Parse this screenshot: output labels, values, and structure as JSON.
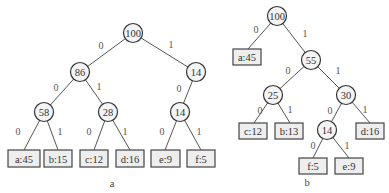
{
  "trees": [
    {
      "caption": "a",
      "nodes": [
        {
          "id": "a_root",
          "label": "100",
          "x": 133,
          "y": 33
        },
        {
          "id": "a_86",
          "label": "86",
          "x": 80,
          "y": 72
        },
        {
          "id": "a_14r",
          "label": "14",
          "x": 196,
          "y": 72
        },
        {
          "id": "a_58",
          "label": "58",
          "x": 44,
          "y": 112
        },
        {
          "id": "a_28",
          "label": "28",
          "x": 108,
          "y": 112
        },
        {
          "id": "a_14",
          "label": "14",
          "x": 180,
          "y": 112
        }
      ],
      "leaves": [
        {
          "id": "a_a",
          "label": "a:45",
          "x": 8,
          "y": 150,
          "w": 32,
          "h": 17
        },
        {
          "id": "a_b",
          "label": "b:15",
          "x": 44,
          "y": 150,
          "w": 28,
          "h": 17
        },
        {
          "id": "a_c",
          "label": "c:12",
          "x": 80,
          "y": 150,
          "w": 28,
          "h": 17
        },
        {
          "id": "a_d",
          "label": "d:16",
          "x": 116,
          "y": 150,
          "w": 28,
          "h": 17
        },
        {
          "id": "a_e",
          "label": "e:9",
          "x": 151,
          "y": 150,
          "w": 29,
          "h": 17
        },
        {
          "id": "a_f",
          "label": "f:5",
          "x": 187,
          "y": 150,
          "w": 28,
          "h": 17
        }
      ],
      "edges": [
        {
          "from": [
            133,
            33
          ],
          "to": [
            80,
            72
          ],
          "label": "0",
          "lx": 101,
          "ly": 45
        },
        {
          "from": [
            133,
            33
          ],
          "to": [
            196,
            72
          ],
          "label": "1",
          "lx": 171,
          "ly": 44
        },
        {
          "from": [
            80,
            72
          ],
          "to": [
            44,
            112
          ],
          "label": "0",
          "lx": 56,
          "ly": 87
        },
        {
          "from": [
            80,
            72
          ],
          "to": [
            108,
            112
          ],
          "label": "1",
          "lx": 99,
          "ly": 86
        },
        {
          "from": [
            196,
            72
          ],
          "to": [
            180,
            112
          ],
          "label": "0",
          "lx": 179,
          "ly": 88
        },
        {
          "from": [
            44,
            112
          ],
          "to": [
            24,
            150
          ],
          "label": "0",
          "lx": 18,
          "ly": 131
        },
        {
          "from": [
            44,
            112
          ],
          "to": [
            58,
            150
          ],
          "label": "1",
          "lx": 60,
          "ly": 131
        },
        {
          "from": [
            108,
            112
          ],
          "to": [
            94,
            150
          ],
          "label": "0",
          "lx": 89,
          "ly": 131
        },
        {
          "from": [
            108,
            112
          ],
          "to": [
            130,
            150
          ],
          "label": "1",
          "lx": 125,
          "ly": 131
        },
        {
          "from": [
            180,
            112
          ],
          "to": [
            165,
            150
          ],
          "label": "0",
          "lx": 162,
          "ly": 131
        },
        {
          "from": [
            180,
            112
          ],
          "to": [
            201,
            150
          ],
          "label": "1",
          "lx": 199,
          "ly": 131
        }
      ],
      "caption_pos": {
        "x": 112,
        "y": 183
      }
    },
    {
      "caption": "b",
      "nodes": [
        {
          "id": "b_root",
          "label": "100",
          "x": 277,
          "y": 16
        },
        {
          "id": "b_55",
          "label": "55",
          "x": 311,
          "y": 60
        },
        {
          "id": "b_25",
          "label": "25",
          "x": 273,
          "y": 95
        },
        {
          "id": "b_30",
          "label": "30",
          "x": 346,
          "y": 95
        },
        {
          "id": "b_14",
          "label": "14",
          "x": 327,
          "y": 130
        }
      ],
      "leaves": [
        {
          "id": "b_a",
          "label": "a:45",
          "x": 233,
          "y": 49,
          "w": 28,
          "h": 16
        },
        {
          "id": "b_c",
          "label": "c:12",
          "x": 239,
          "y": 123,
          "w": 28,
          "h": 16
        },
        {
          "id": "b_b",
          "label": "b:13",
          "x": 275,
          "y": 123,
          "w": 28,
          "h": 16
        },
        {
          "id": "b_d",
          "label": "d:16",
          "x": 356,
          "y": 123,
          "w": 28,
          "h": 16
        },
        {
          "id": "b_f",
          "label": "f:5",
          "x": 299,
          "y": 158,
          "w": 28,
          "h": 16
        },
        {
          "id": "b_e",
          "label": "e:9",
          "x": 335,
          "y": 158,
          "w": 28,
          "h": 16
        }
      ],
      "edges": [
        {
          "from": [
            277,
            16
          ],
          "to": [
            248,
            49
          ],
          "label": "0",
          "lx": 256,
          "ly": 29
        },
        {
          "from": [
            277,
            16
          ],
          "to": [
            311,
            60
          ],
          "label": "1",
          "lx": 305,
          "ly": 33
        },
        {
          "from": [
            311,
            60
          ],
          "to": [
            273,
            95
          ],
          "label": "0",
          "lx": 288,
          "ly": 70
        },
        {
          "from": [
            311,
            60
          ],
          "to": [
            346,
            95
          ],
          "label": "1",
          "lx": 338,
          "ly": 70
        },
        {
          "from": [
            273,
            95
          ],
          "to": [
            254,
            123
          ],
          "label": "0",
          "lx": 260,
          "ly": 110
        },
        {
          "from": [
            273,
            95
          ],
          "to": [
            290,
            123
          ],
          "label": "1",
          "lx": 290,
          "ly": 109
        },
        {
          "from": [
            346,
            95
          ],
          "to": [
            327,
            130
          ],
          "label": "0",
          "lx": 330,
          "ly": 110
        },
        {
          "from": [
            346,
            95
          ],
          "to": [
            370,
            123
          ],
          "label": "1",
          "lx": 365,
          "ly": 109
        },
        {
          "from": [
            327,
            130
          ],
          "to": [
            313,
            158
          ],
          "label": "0",
          "lx": 313,
          "ly": 145
        },
        {
          "from": [
            327,
            130
          ],
          "to": [
            349,
            158
          ],
          "label": "1",
          "lx": 347,
          "ly": 145
        }
      ],
      "caption_pos": {
        "x": 307,
        "y": 182
      }
    }
  ]
}
